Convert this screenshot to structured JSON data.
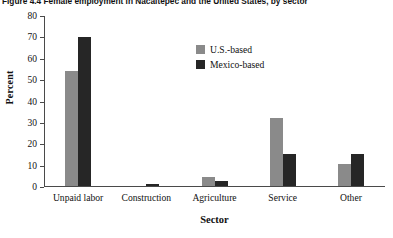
{
  "figure": {
    "title": "Figure 4.4  Female employment in Nacaltepec and the United States, by sector"
  },
  "legend": {
    "items": [
      {
        "label": "U.S.-based",
        "color": "#8a8a8a"
      },
      {
        "label": "Mexico-based",
        "color": "#262626"
      }
    ]
  },
  "chart_data": {
    "type": "bar",
    "title": "Figure 4.4  Female employment in Nacaltepec and the United States, by sector",
    "xlabel": "Sector",
    "ylabel": "Percent",
    "ylim": [
      0,
      80
    ],
    "yticks": [
      0,
      10,
      20,
      30,
      40,
      50,
      60,
      70,
      80
    ],
    "grid": false,
    "legend_position": "upper-center-inside",
    "categories": [
      "Unpaid labor",
      "Construction",
      "Agriculture",
      "Service",
      "Other"
    ],
    "series": [
      {
        "name": "U.S.-based",
        "color": "#8a8a8a",
        "values": [
          54,
          0,
          4,
          32,
          10
        ]
      },
      {
        "name": "Mexico-based",
        "color": "#262626",
        "values": [
          70,
          1,
          2,
          15,
          15
        ]
      }
    ]
  }
}
